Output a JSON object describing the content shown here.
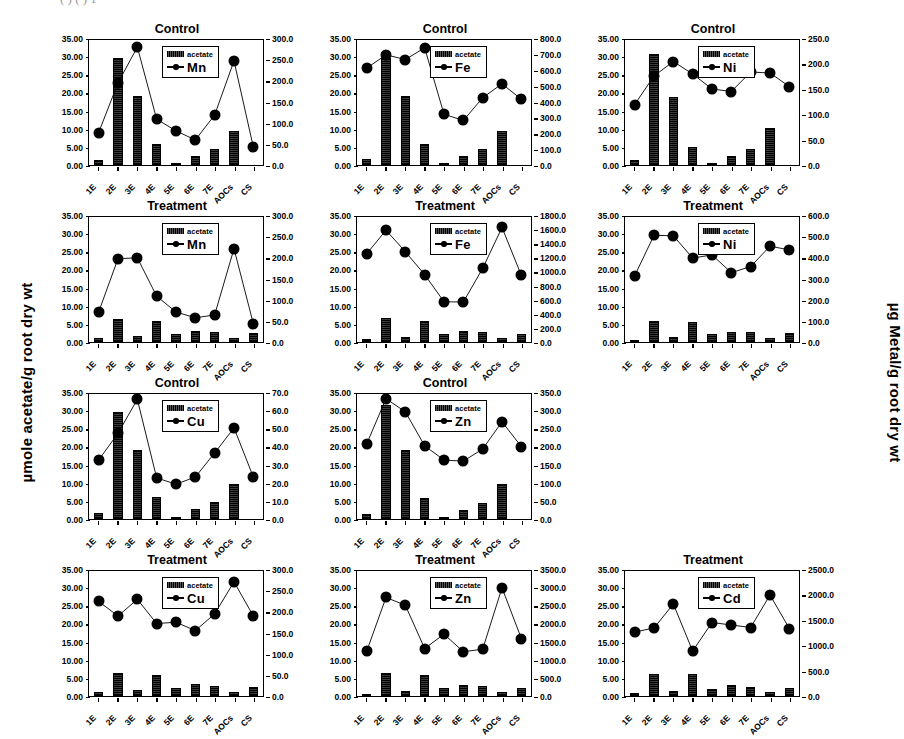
{
  "figure": {
    "left_axis_title": "µmole acetate/g root dry wt",
    "right_axis_title": "µg Metal/g root dry wt",
    "cropped_top_text": "(      ) ( )              1",
    "legend_acetate_label": "acetate",
    "categories": [
      "1E",
      "2E",
      "3E",
      "4E",
      "5E",
      "6E",
      "7E",
      "AOCs",
      "CS"
    ],
    "bar_color": "#111111",
    "line_color": "#000000"
  },
  "chart_data": [
    {
      "id": "mn-control",
      "type": "bar",
      "title": "Control",
      "metal": "Mn",
      "categories": [
        "1E",
        "2E",
        "3E",
        "4E",
        "5E",
        "6E",
        "7E",
        "AOCs",
        "CS"
      ],
      "series": [
        {
          "name": "acetate",
          "type": "bar",
          "axis": "left",
          "values": [
            1.5,
            30.0,
            19.4,
            6.0,
            0.6,
            2.6,
            4.6,
            9.6,
            0.0
          ]
        },
        {
          "name": "Mn",
          "type": "line",
          "axis": "right",
          "values": [
            78,
            197,
            283,
            110,
            82,
            60,
            120,
            250,
            43
          ]
        }
      ],
      "ylabel": "µmole acetate/g root dry wt",
      "y2label": "µg Metal/g root dry wt",
      "ylim": [
        0,
        35
      ],
      "yticks": [
        "0.00",
        "5.00",
        "10.00",
        "15.00",
        "20.00",
        "25.00",
        "30.00",
        "35.00"
      ],
      "y2lim": [
        0,
        300
      ],
      "y2ticks": [
        "0.0",
        "50.0",
        "100.0",
        "150.0",
        "200.0",
        "250.0",
        "300.0"
      ],
      "grid": false,
      "legend_position": "top-center"
    },
    {
      "id": "fe-control",
      "type": "bar",
      "title": "Control",
      "metal": "Fe",
      "categories": [
        "1E",
        "2E",
        "3E",
        "4E",
        "5E",
        "6E",
        "7E",
        "AOCs",
        "CS"
      ],
      "series": [
        {
          "name": "acetate",
          "type": "bar",
          "axis": "left",
          "values": [
            1.7,
            30.0,
            19.4,
            6.0,
            0.5,
            2.6,
            4.6,
            9.6,
            0.0
          ]
        },
        {
          "name": "Fe",
          "type": "line",
          "axis": "right",
          "values": [
            620,
            705,
            675,
            750,
            325,
            285,
            430,
            520,
            420
          ]
        }
      ],
      "ylabel": "µmole acetate/g root dry wt",
      "y2label": "µg Metal/g root dry wt",
      "ylim": [
        0,
        35
      ],
      "yticks": [
        "0.00",
        "5.00",
        "10.00",
        "15.00",
        "20.00",
        "25.00",
        "30.00",
        "35.00"
      ],
      "y2lim": [
        0,
        800
      ],
      "y2ticks": [
        "0.0",
        "100.0",
        "200.0",
        "300.0",
        "400.0",
        "500.0",
        "600.0",
        "700.0",
        "800.0"
      ],
      "grid": false,
      "legend_position": "top-center"
    },
    {
      "id": "ni-control",
      "type": "bar",
      "title": "Control",
      "metal": "Ni",
      "categories": [
        "1E",
        "2E",
        "3E",
        "4E",
        "5E",
        "6E",
        "7E",
        "AOCs",
        "CS"
      ],
      "series": [
        {
          "name": "acetate",
          "type": "bar",
          "axis": "left",
          "values": [
            1.5,
            31.0,
            19.0,
            5.0,
            0.5,
            2.5,
            4.6,
            10.5,
            0.0
          ]
        },
        {
          "name": "Ni",
          "type": "line",
          "axis": "right",
          "values": [
            121,
            178,
            207,
            182,
            152,
            147,
            186,
            184,
            157
          ]
        }
      ],
      "ylabel": "µmole acetate/g root dry wt",
      "y2label": "µg Metal/g root dry wt",
      "ylim": [
        0,
        35
      ],
      "yticks": [
        "0.00",
        "5.00",
        "10.00",
        "15.00",
        "20.00",
        "25.00",
        "30.00",
        "35.00"
      ],
      "y2lim": [
        0,
        250
      ],
      "y2ticks": [
        "0.0",
        "50.0",
        "100.0",
        "150.0",
        "200.0",
        "250.0"
      ],
      "grid": false,
      "legend_position": "top-center"
    },
    {
      "id": "mn-treatment",
      "type": "bar",
      "title": "Treatment",
      "metal": "Mn",
      "categories": [
        "1E",
        "2E",
        "3E",
        "4E",
        "5E",
        "6E",
        "7E",
        "AOCs",
        "CS"
      ],
      "series": [
        {
          "name": "acetate",
          "type": "bar",
          "axis": "left",
          "values": [
            1.0,
            6.5,
            1.6,
            6.0,
            2.3,
            3.2,
            2.8,
            1.2,
            2.5
          ]
        },
        {
          "name": "Mn",
          "type": "line",
          "axis": "right",
          "values": [
            72,
            200,
            202,
            110,
            72,
            58,
            65,
            224,
            44
          ]
        }
      ],
      "ylabel": "µmole acetate/g root dry wt",
      "y2label": "µg Metal/g root dry wt",
      "ylim": [
        0,
        35
      ],
      "yticks": [
        "0.00",
        "5.00",
        "10.00",
        "15.00",
        "20.00",
        "25.00",
        "30.00",
        "35.00"
      ],
      "y2lim": [
        0,
        300
      ],
      "y2ticks": [
        "0.0",
        "50.0",
        "100.0",
        "150.0",
        "200.0",
        "250.0",
        "300.0"
      ],
      "grid": false,
      "legend_position": "top-center"
    },
    {
      "id": "fe-treatment",
      "type": "bar",
      "title": "Treatment",
      "metal": "Fe",
      "categories": [
        "1E",
        "2E",
        "3E",
        "4E",
        "5E",
        "6E",
        "7E",
        "AOCs",
        "CS"
      ],
      "series": [
        {
          "name": "acetate",
          "type": "bar",
          "axis": "left",
          "values": [
            0.8,
            6.6,
            1.5,
            5.8,
            2.2,
            3.2,
            2.7,
            1.1,
            2.3
          ]
        },
        {
          "name": "Fe",
          "type": "line",
          "axis": "right",
          "values": [
            1270,
            1610,
            1300,
            970,
            580,
            575,
            1060,
            1650,
            960
          ]
        }
      ],
      "ylabel": "µmole acetate/g root dry wt",
      "y2label": "µg Metal/g root dry wt",
      "ylim": [
        0,
        35
      ],
      "yticks": [
        "0.00",
        "5.00",
        "10.00",
        "15.00",
        "20.00",
        "25.00",
        "30.00",
        "35.00"
      ],
      "y2lim": [
        0,
        1800
      ],
      "y2ticks": [
        "0.0",
        "200.0",
        "400.0",
        "600.0",
        "800.0",
        "1000.0",
        "1200.0",
        "1400.0",
        "1600.0",
        "1800.0"
      ],
      "grid": false,
      "legend_position": "top-center"
    },
    {
      "id": "ni-treatment",
      "type": "bar",
      "title": "Treatment",
      "metal": "Ni",
      "categories": [
        "1E",
        "2E",
        "3E",
        "4E",
        "5E",
        "6E",
        "7E",
        "AOCs",
        "CS"
      ],
      "series": [
        {
          "name": "acetate",
          "type": "bar",
          "axis": "left",
          "values": [
            0.6,
            5.8,
            1.3,
            5.7,
            2.2,
            2.9,
            2.7,
            1.0,
            2.4
          ]
        },
        {
          "name": "Ni",
          "type": "line",
          "axis": "right",
          "values": [
            318,
            512,
            510,
            403,
            418,
            333,
            362,
            460,
            442
          ]
        }
      ],
      "ylabel": "µmole acetate/g root dry wt",
      "y2label": "µg Metal/g root dry wt",
      "ylim": [
        0,
        35
      ],
      "yticks": [
        "0.00",
        "5.00",
        "10.00",
        "15.00",
        "20.00",
        "25.00",
        "30.00",
        "35.00"
      ],
      "y2lim": [
        0,
        600
      ],
      "y2ticks": [
        "0.0",
        "100.0",
        "200.0",
        "300.0",
        "400.0",
        "500.0",
        "600.0"
      ],
      "grid": false,
      "legend_position": "top-center"
    },
    {
      "id": "cu-control",
      "type": "bar",
      "title": "Control",
      "metal": "Cu",
      "categories": [
        "1E",
        "2E",
        "3E",
        "4E",
        "5E",
        "6E",
        "7E",
        "AOCs",
        "CS"
      ],
      "series": [
        {
          "name": "acetate",
          "type": "bar",
          "axis": "left",
          "values": [
            1.7,
            30.0,
            19.3,
            6.1,
            0.6,
            2.8,
            4.7,
            9.7,
            0.0
          ]
        },
        {
          "name": "Cu",
          "type": "line",
          "axis": "right",
          "values": [
            33,
            48,
            67,
            23,
            19.5,
            23.5,
            37,
            51,
            23.5
          ]
        }
      ],
      "ylabel": "µmole acetate/g root dry wt",
      "y2label": "µg Metal/g root dry wt",
      "ylim": [
        0,
        35
      ],
      "yticks": [
        "0.00",
        "5.00",
        "10.00",
        "15.00",
        "20.00",
        "25.00",
        "30.00",
        "35.00"
      ],
      "y2lim": [
        0,
        70
      ],
      "y2ticks": [
        "0.0",
        "10.0",
        "20.0",
        "30.0",
        "40.0",
        "50.0",
        "60.0",
        "70.0"
      ],
      "grid": false,
      "legend_position": "top-center"
    },
    {
      "id": "zn-control",
      "type": "bar",
      "title": "Control",
      "metal": "Zn",
      "categories": [
        "1E",
        "2E",
        "3E",
        "4E",
        "5E",
        "6E",
        "7E",
        "AOCs",
        "CS"
      ],
      "series": [
        {
          "name": "acetate",
          "type": "bar",
          "axis": "left",
          "values": [
            1.5,
            32.0,
            19.2,
            6.0,
            0.6,
            2.6,
            4.6,
            9.8,
            0.0
          ]
        },
        {
          "name": "Zn",
          "type": "line",
          "axis": "right",
          "values": [
            210,
            337,
            300,
            205,
            165,
            162,
            196,
            272,
            203
          ]
        }
      ],
      "ylabel": "µmole acetate/g root dry wt",
      "y2label": "µg Metal/g root dry wt",
      "ylim": [
        0,
        35
      ],
      "yticks": [
        "0.00",
        "5.00",
        "10.00",
        "15.00",
        "20.00",
        "25.00",
        "30.00",
        "35.00"
      ],
      "y2lim": [
        0,
        350
      ],
      "y2ticks": [
        "0.0",
        "50.0",
        "100.0",
        "150.0",
        "200.0",
        "250.0",
        "300.0",
        "350.0"
      ],
      "grid": false,
      "legend_position": "top-center"
    },
    {
      "id": "cu-treatment",
      "type": "bar",
      "title": "Treatment",
      "metal": "Cu",
      "categories": [
        "1E",
        "2E",
        "3E",
        "4E",
        "5E",
        "6E",
        "7E",
        "AOCs",
        "CS"
      ],
      "series": [
        {
          "name": "acetate",
          "type": "bar",
          "axis": "left",
          "values": [
            1.0,
            6.4,
            1.6,
            5.8,
            2.2,
            3.3,
            2.9,
            1.1,
            2.4
          ]
        },
        {
          "name": "Cu",
          "type": "line",
          "axis": "right",
          "values": [
            227,
            192,
            232,
            174,
            177,
            157,
            197,
            274,
            192
          ]
        }
      ],
      "ylabel": "µmole acetate/g root dry wt",
      "y2label": "µg Metal/g root dry wt",
      "ylim": [
        0,
        35
      ],
      "yticks": [
        "0.00",
        "5.00",
        "10.00",
        "15.00",
        "20.00",
        "25.00",
        "30.00",
        "35.00"
      ],
      "y2lim": [
        0,
        300
      ],
      "y2ticks": [
        "0.0",
        "50.0",
        "100.0",
        "150.0",
        "200.0",
        "250.0",
        "300.0"
      ],
      "grid": false,
      "legend_position": "top-center"
    },
    {
      "id": "zn-treatment",
      "type": "bar",
      "title": "Treatment",
      "metal": "Zn",
      "categories": [
        "1E",
        "2E",
        "3E",
        "4E",
        "5E",
        "6E",
        "7E",
        "AOCs",
        "CS"
      ],
      "series": [
        {
          "name": "acetate",
          "type": "bar",
          "axis": "left",
          "values": [
            0.7,
            6.5,
            1.5,
            5.8,
            2.2,
            3.2,
            2.8,
            1.0,
            2.3
          ]
        },
        {
          "name": "Zn",
          "type": "line",
          "axis": "right",
          "values": [
            1250,
            2760,
            2540,
            1330,
            1730,
            1240,
            1310,
            3030,
            1610
          ]
        }
      ],
      "ylabel": "µmole acetate/g root dry wt",
      "y2label": "µg Metal/g root dry wt",
      "ylim": [
        0,
        35
      ],
      "yticks": [
        "0.00",
        "5.00",
        "10.00",
        "15.00",
        "20.00",
        "25.00",
        "30.00",
        "35.00"
      ],
      "y2lim": [
        0,
        3500
      ],
      "y2ticks": [
        "0.0",
        "500.0",
        "1000.0",
        "1500.0",
        "2000.0",
        "2500.0",
        "3000.0",
        "3500.0"
      ],
      "grid": false,
      "legend_position": "top-center"
    },
    {
      "id": "cd-treatment",
      "type": "bar",
      "title": "Treatment",
      "metal": "Cd",
      "categories": [
        "1E",
        "2E",
        "3E",
        "4E",
        "5E",
        "6E",
        "7E",
        "AOCs",
        "CS"
      ],
      "series": [
        {
          "name": "acetate",
          "type": "bar",
          "axis": "left",
          "values": [
            0.8,
            6.2,
            1.4,
            6.3,
            2.1,
            3.0,
            2.6,
            1.0,
            2.2
          ]
        },
        {
          "name": "Cd",
          "type": "line",
          "axis": "right",
          "values": [
            1280,
            1360,
            1840,
            900,
            1470,
            1420,
            1370,
            2020,
            1350
          ]
        }
      ],
      "ylabel": "µmole acetate/g root dry wt",
      "y2label": "µg Metal/g root dry wt",
      "ylim": [
        0,
        35
      ],
      "yticks": [
        "0.00",
        "5.00",
        "10.00",
        "15.00",
        "20.00",
        "25.00",
        "30.00",
        "35.00"
      ],
      "y2lim": [
        0,
        2500
      ],
      "y2ticks": [
        "0.0",
        "500.0",
        "1000.0",
        "1500.0",
        "2000.0",
        "2500.0"
      ],
      "grid": false,
      "legend_position": "top-center"
    }
  ],
  "layout": {
    "rows": [
      [
        "mn-control",
        "fe-control",
        "ni-control"
      ],
      [
        "mn-treatment",
        "fe-treatment",
        "ni-treatment"
      ],
      [
        "cu-control",
        "zn-control",
        null
      ],
      [
        "cu-treatment",
        "zn-treatment",
        "cd-treatment"
      ]
    ]
  }
}
